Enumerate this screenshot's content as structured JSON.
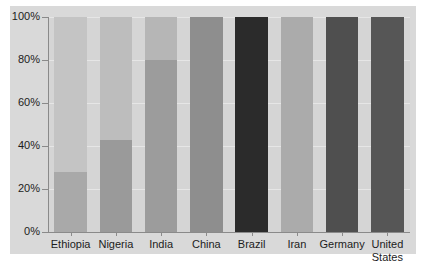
{
  "chart_data": {
    "type": "bar",
    "title": "",
    "subtitle": "",
    "xlabel": "",
    "ylabel": "",
    "ylim": [
      0,
      100
    ],
    "grid": true,
    "legend": "none",
    "y_tick_labels": [
      "0%",
      "20%",
      "40%",
      "60%",
      "80%",
      "100%"
    ],
    "y_tick_values": [
      0,
      20,
      40,
      60,
      80,
      100
    ],
    "categories": [
      "Ethiopia",
      "Nigeria",
      "India",
      "China",
      "Brazil",
      "Iran",
      "Germany",
      "United States"
    ],
    "values": [
      100,
      100,
      100,
      100,
      100,
      100,
      100,
      100
    ],
    "series": [
      {
        "name": "lower-segment",
        "values": [
          28,
          43,
          80,
          100,
          100,
          100,
          100,
          100
        ]
      },
      {
        "name": "upper-segment",
        "values": [
          72,
          57,
          20,
          0,
          0,
          0,
          0,
          0
        ]
      }
    ],
    "bar_colors": [
      "#a9a9a9",
      "#9a9a9a",
      "#9c9c9c",
      "#8e8e8e",
      "#2b2b2b",
      "#ababab",
      "#4f4f4f",
      "#565656"
    ],
    "bar_colors_upper": [
      "#c4c4c4",
      "#bdbdbd",
      "#b6b6b6",
      "#8e8e8e",
      "#2b2b2b",
      "#ababab",
      "#4f4f4f",
      "#565656"
    ],
    "plot_background": "#d5d5d5",
    "panel_background": "#d9d9d9",
    "gridline_color": "#e6e6e6",
    "axis_color": "#8a8a8a",
    "text_color": "#1c1c1c"
  }
}
